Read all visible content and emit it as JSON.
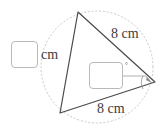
{
  "figure": {
    "type": "geometry-diagram",
    "colors": {
      "triangle_stroke": "#4a4a4a",
      "circle_stroke": "#c8c8c8",
      "leader_stroke": "#8c8c8c",
      "text": "#3c3c3c",
      "box_border": "#b9b9bd",
      "background": "#ffffff"
    },
    "triangle": {
      "vertices": {
        "apex": {
          "x": 78,
          "y": 12
        },
        "bottom_left": {
          "x": 60,
          "y": 113
        },
        "right": {
          "x": 155,
          "y": 82
        }
      }
    },
    "circle": {
      "center_x": 97,
      "center_y": 67,
      "radius": 56,
      "style": "dotted"
    },
    "labels": {
      "side_right": "8 cm",
      "side_bottom": "8 cm",
      "side_left_unit": "cm",
      "degree_symbol": "°"
    },
    "inputs": {
      "side_length": {
        "value": "",
        "placeholder": ""
      },
      "angle": {
        "value": "",
        "placeholder": ""
      }
    }
  }
}
